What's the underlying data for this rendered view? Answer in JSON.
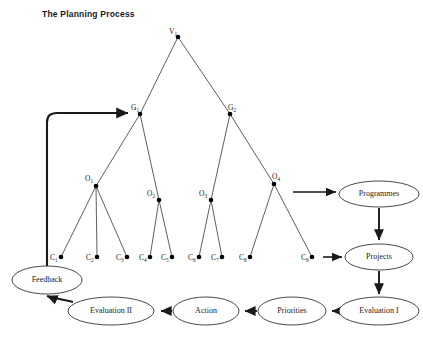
{
  "title": "The Planning Process",
  "diagram": {
    "type": "tree-and-flow",
    "tree_nodes": [
      {
        "id": "V1",
        "label": "V",
        "sub": "1",
        "x": 178,
        "y": 37,
        "label_x": 169,
        "label_y": 34
      },
      {
        "id": "G1",
        "label": "G",
        "sub": "1",
        "x": 140,
        "y": 114,
        "label_x": 131,
        "label_y": 110
      },
      {
        "id": "G2",
        "label": "G",
        "sub": "2",
        "x": 230,
        "y": 114,
        "label_x": 228,
        "label_y": 110
      },
      {
        "id": "O1",
        "label": "O",
        "sub": "1",
        "x": 96,
        "y": 186,
        "label_x": 85,
        "label_y": 181
      },
      {
        "id": "O2",
        "label": "O",
        "sub": "2",
        "x": 159,
        "y": 200,
        "label_x": 147,
        "label_y": 196
      },
      {
        "id": "O3",
        "label": "O",
        "sub": "3",
        "x": 211,
        "y": 200,
        "label_x": 199,
        "label_y": 196
      },
      {
        "id": "O4",
        "label": "O",
        "sub": "4",
        "x": 274,
        "y": 184,
        "label_x": 272,
        "label_y": 179
      },
      {
        "id": "C1",
        "label": "C",
        "sub": "1",
        "x": 61,
        "y": 257,
        "label_x": 50,
        "label_y": 260
      },
      {
        "id": "C2",
        "label": "C",
        "sub": "2",
        "x": 97,
        "y": 257,
        "label_x": 86,
        "label_y": 260
      },
      {
        "id": "C3",
        "label": "C",
        "sub": "3",
        "x": 127,
        "y": 257,
        "label_x": 116,
        "label_y": 260
      },
      {
        "id": "C4",
        "label": "C",
        "sub": "4",
        "x": 150,
        "y": 257,
        "label_x": 139,
        "label_y": 260
      },
      {
        "id": "C5",
        "label": "C",
        "sub": "5",
        "x": 172,
        "y": 257,
        "label_x": 161,
        "label_y": 260
      },
      {
        "id": "C6",
        "label": "C",
        "sub": "6",
        "x": 199,
        "y": 257,
        "label_x": 188,
        "label_y": 260
      },
      {
        "id": "C7",
        "label": "C",
        "sub": "7",
        "x": 222,
        "y": 257,
        "label_x": 211,
        "label_y": 260
      },
      {
        "id": "C8",
        "label": "C",
        "sub": "8",
        "x": 250,
        "y": 257,
        "label_x": 239,
        "label_y": 260
      },
      {
        "id": "C9",
        "label": "C",
        "sub": "9",
        "x": 312,
        "y": 257,
        "label_x": 301,
        "label_y": 260
      }
    ],
    "tree_edges": [
      {
        "from": "V1",
        "to": "G1"
      },
      {
        "from": "V1",
        "to": "G2"
      },
      {
        "from": "G1",
        "to": "O1"
      },
      {
        "from": "G1",
        "to": "O2"
      },
      {
        "from": "G2",
        "to": "O3"
      },
      {
        "from": "G2",
        "to": "O4"
      },
      {
        "from": "O1",
        "to": "C1"
      },
      {
        "from": "O1",
        "to": "C2"
      },
      {
        "from": "O1",
        "to": "C3"
      },
      {
        "from": "O2",
        "to": "C4"
      },
      {
        "from": "O2",
        "to": "C5"
      },
      {
        "from": "O3",
        "to": "C6"
      },
      {
        "from": "O3",
        "to": "C7"
      },
      {
        "from": "O4",
        "to": "C8"
      },
      {
        "from": "O4",
        "to": "C9"
      }
    ],
    "process_nodes": [
      {
        "id": "programmes",
        "label": "Programmes",
        "cx": 379,
        "cy": 194,
        "rx": 40,
        "ry": 13
      },
      {
        "id": "projects",
        "label": "Projects",
        "cx": 379,
        "cy": 257,
        "rx": 34,
        "ry": 13
      },
      {
        "id": "evaluation1",
        "label": "Evaluation I",
        "cx": 379,
        "cy": 311,
        "rx": 40,
        "ry": 14
      },
      {
        "id": "priorities",
        "label": "Priorities",
        "cx": 292,
        "cy": 311,
        "rx": 34,
        "ry": 14
      },
      {
        "id": "action",
        "label": "Action",
        "cx": 206,
        "cy": 311,
        "rx": 33,
        "ry": 14
      },
      {
        "id": "evaluation2",
        "label": "Evaluation II",
        "cx": 111,
        "cy": 311,
        "rx": 43,
        "ry": 14
      },
      {
        "id": "feedback",
        "label": "Feedback",
        "cx": 47,
        "cy": 280,
        "rx": 35,
        "ry": 14
      }
    ],
    "process_edges": [
      {
        "from": "O4",
        "to": "programmes",
        "kind": "thin"
      },
      {
        "from": "C9",
        "to": "projects",
        "kind": "thin"
      },
      {
        "from": "programmes",
        "to": "projects",
        "kind": "flow"
      },
      {
        "from": "projects",
        "to": "evaluation1",
        "kind": "flow"
      },
      {
        "from": "evaluation1",
        "to": "priorities",
        "kind": "flow"
      },
      {
        "from": "priorities",
        "to": "action",
        "kind": "flow"
      },
      {
        "from": "action",
        "to": "evaluation2",
        "kind": "flow"
      },
      {
        "from": "evaluation2",
        "to": "feedback",
        "kind": "curve"
      },
      {
        "from": "feedback",
        "to": "G1",
        "kind": "feedback-loop"
      }
    ]
  }
}
